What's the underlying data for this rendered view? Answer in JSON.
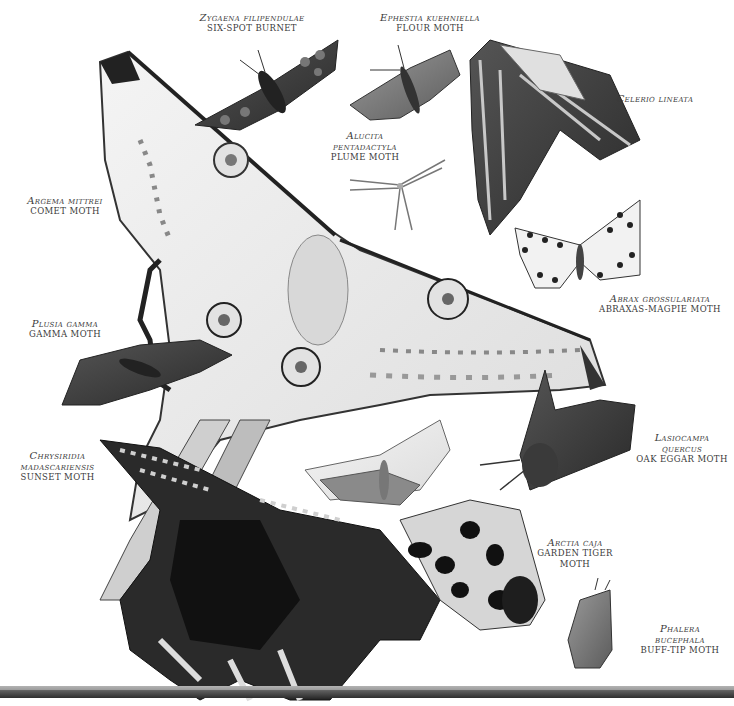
{
  "plate": {
    "background": "#ffffff",
    "ink": "#3a3a3a",
    "labels": [
      {
        "id": "zygaena",
        "scientific": "Zygaena filipendulae",
        "common": "SIX-SPOT BURNET",
        "x": 182,
        "y": 12,
        "w": 140
      },
      {
        "id": "ephestia",
        "scientific": "Ephestia kuehniella",
        "common": "FLOUR MOTH",
        "x": 360,
        "y": 12,
        "w": 140
      },
      {
        "id": "celerio",
        "scientific": "Celerio lineata",
        "common": "",
        "x": 595,
        "y": 93,
        "w": 120
      },
      {
        "id": "alucita",
        "scientific": "Alucita",
        "scientific_2": "pentadactyla",
        "common": "PLUME MOTH",
        "x": 300,
        "y": 130,
        "w": 130
      },
      {
        "id": "argema",
        "scientific": "Argema mittrei",
        "common": "COMET MOTH",
        "x": 10,
        "y": 195,
        "w": 110
      },
      {
        "id": "abraxas",
        "scientific": "Abrax grossulariata",
        "common": "ABRAXAS-MAGPIE MOTH",
        "x": 590,
        "y": 293,
        "w": 140
      },
      {
        "id": "plusia",
        "scientific": "Plusia gamma",
        "common": "GAMMA MOTH",
        "x": 15,
        "y": 318,
        "w": 100
      },
      {
        "id": "chrysiridia",
        "scientific": "Chrysiridia",
        "scientific_2": "madascariensis",
        "common": "SUNSET MOTH",
        "x": 10,
        "y": 450,
        "w": 95
      },
      {
        "id": "lasiocampa",
        "scientific": "Lasiocampa",
        "scientific_2": "quercus",
        "common": "OAK EGGAR MOTH",
        "x": 630,
        "y": 432,
        "w": 104
      },
      {
        "id": "arctia",
        "scientific": "Arctia caja",
        "common": "GARDEN TIGER",
        "common_2": "MOTH",
        "x": 530,
        "y": 537,
        "w": 90
      },
      {
        "id": "phalera",
        "scientific": "Phalera",
        "scientific_2": "bucephala",
        "common": "BUFF-TIP MOTH",
        "x": 630,
        "y": 623,
        "w": 100
      }
    ]
  }
}
